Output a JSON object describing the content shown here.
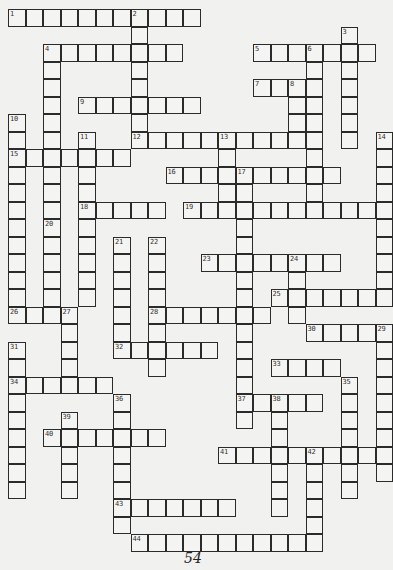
{
  "puzzle": {
    "type": "crossword",
    "page_number": "54",
    "grid_origin": {
      "x": 8,
      "y": 9
    },
    "cell_size": 17.5,
    "colors": {
      "background": "#f1f1ef",
      "cell": "#f4f4f2",
      "border": "#2b2b2b"
    },
    "entries": [
      {
        "number": 1,
        "direction": "across",
        "row": 0,
        "col": 0,
        "length": 11
      },
      {
        "number": 2,
        "direction": "down",
        "row": 0,
        "col": 7,
        "length": 8
      },
      {
        "number": 3,
        "direction": "down",
        "row": 1,
        "col": 19,
        "length": 7
      },
      {
        "number": 4,
        "direction": "across",
        "row": 2,
        "col": 2,
        "length": 8
      },
      {
        "number": 4,
        "direction": "down",
        "row": 2,
        "col": 2,
        "length": 10
      },
      {
        "number": 5,
        "direction": "across",
        "row": 2,
        "col": 14,
        "length": 7
      },
      {
        "number": 6,
        "direction": "down",
        "row": 2,
        "col": 17,
        "length": 9
      },
      {
        "number": 7,
        "direction": "across",
        "row": 4,
        "col": 14,
        "length": 4
      },
      {
        "number": 8,
        "direction": "down",
        "row": 4,
        "col": 16,
        "length": 4
      },
      {
        "number": 9,
        "direction": "across",
        "row": 5,
        "col": 4,
        "length": 7
      },
      {
        "number": 10,
        "direction": "down",
        "row": 6,
        "col": 0,
        "length": 12
      },
      {
        "number": 11,
        "direction": "down",
        "row": 7,
        "col": 4,
        "length": 10
      },
      {
        "number": 12,
        "direction": "across",
        "row": 7,
        "col": 7,
        "length": 10
      },
      {
        "number": 13,
        "direction": "down",
        "row": 7,
        "col": 12,
        "length": 5
      },
      {
        "number": 14,
        "direction": "down",
        "row": 7,
        "col": 21,
        "length": 10
      },
      {
        "number": 15,
        "direction": "across",
        "row": 8,
        "col": 0,
        "length": 7
      },
      {
        "number": 16,
        "direction": "across",
        "row": 9,
        "col": 9,
        "length": 10
      },
      {
        "number": 17,
        "direction": "down",
        "row": 9,
        "col": 13,
        "length": 15
      },
      {
        "number": 18,
        "direction": "across",
        "row": 11,
        "col": 4,
        "length": 5
      },
      {
        "number": 19,
        "direction": "across",
        "row": 11,
        "col": 10,
        "length": 12
      },
      {
        "number": 20,
        "direction": "down",
        "row": 12,
        "col": 2,
        "length": 6
      },
      {
        "number": 21,
        "direction": "down",
        "row": 13,
        "col": 6,
        "length": 7
      },
      {
        "number": 22,
        "direction": "down",
        "row": 13,
        "col": 8,
        "length": 8
      },
      {
        "number": 23,
        "direction": "across",
        "row": 14,
        "col": 11,
        "length": 8
      },
      {
        "number": 24,
        "direction": "down",
        "row": 14,
        "col": 16,
        "length": 4
      },
      {
        "number": 25,
        "direction": "across",
        "row": 16,
        "col": 15,
        "length": 7
      },
      {
        "number": 26,
        "direction": "across",
        "row": 17,
        "col": 0,
        "length": 4
      },
      {
        "number": 27,
        "direction": "down",
        "row": 17,
        "col": 3,
        "length": 5
      },
      {
        "number": 28,
        "direction": "across",
        "row": 17,
        "col": 8,
        "length": 7
      },
      {
        "number": 29,
        "direction": "down",
        "row": 18,
        "col": 21,
        "length": 9
      },
      {
        "number": 30,
        "direction": "across",
        "row": 18,
        "col": 17,
        "length": 5
      },
      {
        "number": 31,
        "direction": "down",
        "row": 19,
        "col": 0,
        "length": 9
      },
      {
        "number": 32,
        "direction": "across",
        "row": 19,
        "col": 6,
        "length": 6
      },
      {
        "number": 33,
        "direction": "across",
        "row": 20,
        "col": 15,
        "length": 4
      },
      {
        "number": 34,
        "direction": "across",
        "row": 21,
        "col": 0,
        "length": 6
      },
      {
        "number": 35,
        "direction": "down",
        "row": 21,
        "col": 19,
        "length": 7
      },
      {
        "number": 36,
        "direction": "down",
        "row": 22,
        "col": 6,
        "length": 8
      },
      {
        "number": 37,
        "direction": "across",
        "row": 22,
        "col": 13,
        "length": 5
      },
      {
        "number": 38,
        "direction": "down",
        "row": 22,
        "col": 15,
        "length": 7
      },
      {
        "number": 39,
        "direction": "down",
        "row": 23,
        "col": 3,
        "length": 5
      },
      {
        "number": 40,
        "direction": "across",
        "row": 24,
        "col": 2,
        "length": 7
      },
      {
        "number": 41,
        "direction": "across",
        "row": 25,
        "col": 12,
        "length": 9
      },
      {
        "number": 42,
        "direction": "down",
        "row": 25,
        "col": 17,
        "length": 6
      },
      {
        "number": 43,
        "direction": "across",
        "row": 28,
        "col": 6,
        "length": 7
      },
      {
        "number": 44,
        "direction": "across",
        "row": 30,
        "col": 7,
        "length": 11
      }
    ]
  }
}
